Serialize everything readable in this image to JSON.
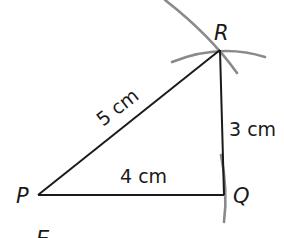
{
  "diagram": {
    "title": "",
    "type": "triangle construction with compass arcs",
    "vertices": [
      {
        "id": "P",
        "label": "P"
      },
      {
        "id": "Q",
        "label": "Q"
      },
      {
        "id": "R",
        "label": "R"
      }
    ],
    "sides": [
      {
        "from": "P",
        "to": "R",
        "label": "5 cm"
      },
      {
        "from": "R",
        "to": "Q",
        "label": "3 cm"
      },
      {
        "from": "P",
        "to": "Q",
        "label": "4 cm"
      }
    ],
    "extra_label": "E",
    "colors": {
      "line": "#1a1a1a",
      "arc": "#8a8a8a",
      "background": "#ffffff"
    }
  }
}
